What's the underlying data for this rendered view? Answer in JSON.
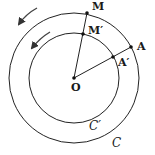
{
  "diagram": {
    "type": "concentric-circles-rotation",
    "colors": {
      "stroke": "#222222",
      "background": "#ffffff"
    },
    "center": {
      "label": "O",
      "x": 74,
      "y": 78
    },
    "circles": [
      {
        "name": "outer",
        "label": "C",
        "radius": 65
      },
      {
        "name": "inner",
        "label": "C′",
        "radius": 45
      }
    ],
    "points": {
      "M": {
        "label": "M",
        "x": 87,
        "y": 13
      },
      "M_prime": {
        "label": "M′",
        "x": 83,
        "y": 34
      },
      "A": {
        "label": "A",
        "x": 131,
        "y": 47
      },
      "A_prime": {
        "label": "A′",
        "x": 113,
        "y": 57
      }
    },
    "segments": [
      {
        "from": "O",
        "to": "M"
      },
      {
        "from": "O",
        "to": "A"
      }
    ],
    "arrows": [
      {
        "name": "outer-rotation",
        "direction": "counterclockwise"
      },
      {
        "name": "inner-rotation",
        "direction": "counterclockwise"
      }
    ]
  }
}
